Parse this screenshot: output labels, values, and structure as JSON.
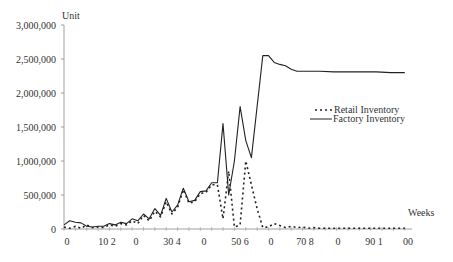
{
  "chart_data": {
    "type": "line",
    "title": "",
    "xlabel": "Weeks",
    "ylabel": "Unit",
    "ylim": [
      0,
      3000000
    ],
    "grid": false,
    "legend_position": "right-middle",
    "y_ticks": [
      "0",
      "500,000",
      "1,000,000",
      "1,500,000",
      "2,000,000",
      "2,500,000",
      "3,000,000"
    ],
    "y_tick_values": [
      0,
      500000,
      1000000,
      1500000,
      2000000,
      2500000,
      3000000
    ],
    "x_tick_labels": [
      "0",
      "10 2",
      "0",
      "30 4",
      "0",
      "50 6",
      "0",
      "70 8",
      "0",
      "90 1",
      "00"
    ],
    "legend": [
      "Retail Inventory",
      "Factory Inventory"
    ],
    "series": [
      {
        "name": "Factory Inventory",
        "style": "solid",
        "x": [
          0,
          2,
          4,
          6,
          8,
          10,
          12,
          14,
          16,
          18,
          20,
          22,
          24,
          26,
          28,
          30,
          32,
          34,
          36,
          38,
          40,
          42,
          44,
          46,
          48,
          50,
          52,
          54,
          56,
          58,
          60,
          62,
          64,
          66,
          68,
          70,
          72,
          74,
          76,
          78,
          80,
          82,
          84,
          86,
          88,
          90,
          95,
          100,
          105,
          110,
          115,
          120
        ],
        "values": [
          60000,
          120000,
          100000,
          90000,
          40000,
          30000,
          40000,
          40000,
          80000,
          60000,
          100000,
          80000,
          150000,
          120000,
          220000,
          150000,
          300000,
          200000,
          450000,
          250000,
          350000,
          600000,
          400000,
          420000,
          550000,
          560000,
          680000,
          680000,
          1550000,
          500000,
          1000000,
          1800000,
          1300000,
          1050000,
          1800000,
          2550000,
          2550000,
          2450000,
          2420000,
          2400000,
          2350000,
          2320000,
          2320000,
          2320000,
          2320000,
          2320000,
          2310000,
          2310000,
          2310000,
          2310000,
          2300000,
          2300000
        ]
      },
      {
        "name": "Retail Inventory",
        "style": "dotted",
        "x": [
          0,
          2,
          4,
          6,
          8,
          10,
          12,
          14,
          16,
          18,
          20,
          22,
          24,
          26,
          28,
          30,
          32,
          34,
          36,
          38,
          40,
          42,
          44,
          46,
          48,
          50,
          52,
          54,
          56,
          58,
          60,
          62,
          64,
          66,
          68,
          70,
          72,
          74,
          76,
          78,
          80,
          82,
          84,
          86,
          88,
          90,
          95,
          100,
          105,
          110,
          115,
          120
        ],
        "values": [
          30000,
          10000,
          40000,
          10000,
          60000,
          20000,
          30000,
          20000,
          60000,
          40000,
          80000,
          60000,
          120000,
          80000,
          200000,
          120000,
          260000,
          180000,
          400000,
          220000,
          320000,
          580000,
          380000,
          400000,
          520000,
          540000,
          650000,
          650000,
          150000,
          850000,
          30000,
          60000,
          1000000,
          650000,
          300000,
          20000,
          30000,
          80000,
          50000,
          20000,
          40000,
          20000,
          30000,
          10000,
          20000,
          10000,
          10000,
          10000,
          10000,
          10000,
          10000,
          10000
        ]
      }
    ]
  },
  "axes": {
    "y_title": "Unit",
    "x_title": "Weeks"
  },
  "legend": {
    "retail_label": "Retail Inventory",
    "factory_label": "Factory Inventory"
  }
}
